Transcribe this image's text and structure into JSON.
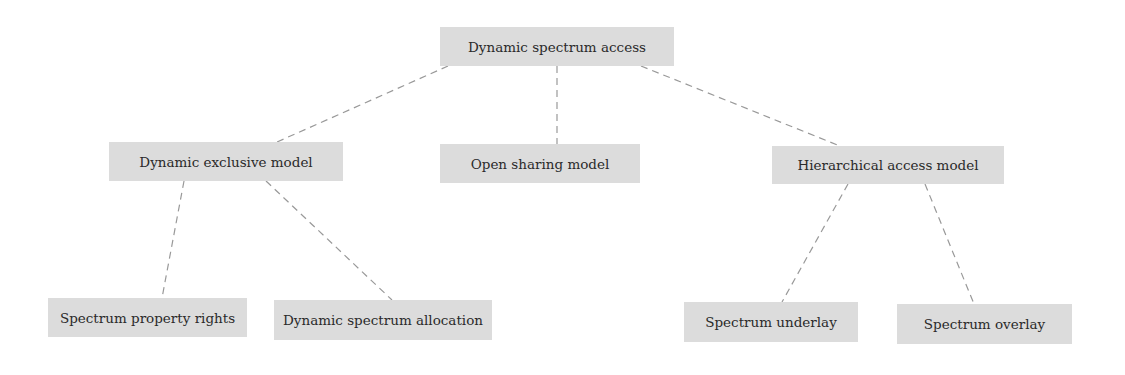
{
  "diagram": {
    "type": "tree",
    "colors": {
      "box_fill": "#dcdcdc",
      "text": "#2a2a2a",
      "line": "#999999"
    },
    "nodes": {
      "root": {
        "label": "Dynamic spectrum access"
      },
      "exclusive": {
        "label": "Dynamic exclusive model"
      },
      "open": {
        "label": "Open sharing model"
      },
      "hierarchical": {
        "label": "Hierarchical access model"
      },
      "property_rights": {
        "label": "Spectrum property rights"
      },
      "allocation": {
        "label": "Dynamic spectrum allocation"
      },
      "underlay": {
        "label": "Spectrum underlay"
      },
      "overlay": {
        "label": "Spectrum overlay"
      }
    },
    "edges": [
      [
        "root",
        "exclusive"
      ],
      [
        "root",
        "open"
      ],
      [
        "root",
        "hierarchical"
      ],
      [
        "exclusive",
        "property_rights"
      ],
      [
        "exclusive",
        "allocation"
      ],
      [
        "hierarchical",
        "underlay"
      ],
      [
        "hierarchical",
        "overlay"
      ]
    ]
  }
}
